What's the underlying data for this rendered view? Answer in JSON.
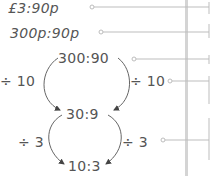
{
  "diagram": {
    "lines": {
      "ratio_pounds": "£3:90p",
      "ratio_pence": "300p:90p",
      "ratio_start": "300:90",
      "ratio_mid": "30:9",
      "ratio_end": "10:3"
    },
    "operations": {
      "left_top": "÷ 10",
      "right_top": "÷ 10",
      "left_bottom": "÷ 3",
      "right_bottom": "÷ 3"
    },
    "colors": {
      "text": "#555555",
      "leader_line": "#bbbbbb",
      "arrow": "#444444"
    }
  }
}
